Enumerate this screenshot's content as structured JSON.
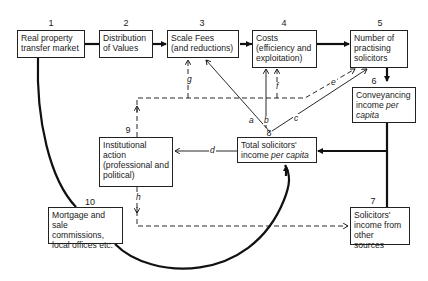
{
  "diagram": {
    "nodes": [
      {
        "id": "1",
        "number": "1",
        "lines": [
          "Real property",
          "transfer market"
        ]
      },
      {
        "id": "2",
        "number": "2",
        "lines": [
          "Distribution",
          "of Values"
        ]
      },
      {
        "id": "3",
        "number": "3",
        "lines": [
          "Scale Fees",
          "(and reductions)"
        ]
      },
      {
        "id": "4",
        "number": "4",
        "lines": [
          "Costs",
          "(efficiency and",
          "exploitation)"
        ]
      },
      {
        "id": "5",
        "number": "5",
        "lines": [
          "Number of",
          "practising",
          "solicitors"
        ]
      },
      {
        "id": "6",
        "number": "6",
        "lines": [
          "Conveyancing",
          "income ",
          "capita"
        ],
        "italic_parts": [
          "per"
        ]
      },
      {
        "id": "7",
        "number": "7",
        "lines": [
          "Solicitors'",
          "income from",
          "other sources"
        ]
      },
      {
        "id": "8",
        "number": "8",
        "lines": [
          "Total solicitors'",
          "income "
        ],
        "italic_parts": [
          "per capita"
        ]
      },
      {
        "id": "9",
        "number": "9",
        "lines": [
          "Institutional",
          "action",
          "(professional and",
          "political)"
        ]
      },
      {
        "id": "10",
        "number": "10",
        "lines": [
          "Mortgage and",
          "sale commissions,",
          "local offices etc."
        ]
      }
    ],
    "box6": {
      "line1": "Conveyancing",
      "line2a": "income ",
      "line2b": "per",
      "line3": "capita"
    },
    "box8": {
      "line1": "Total solicitors'",
      "line2a": "income ",
      "line2b": "per capita"
    },
    "edge_labels": {
      "a": "a",
      "b": "b",
      "c": "c",
      "d": "d",
      "e": "e",
      "f": "f",
      "g": "g",
      "h": "h"
    },
    "edges": [
      {
        "from": "1",
        "to": "2",
        "style": "thick"
      },
      {
        "from": "2",
        "to": "3",
        "style": "thick-arrow"
      },
      {
        "from": "3",
        "to": "4",
        "style": "thick-arrow"
      },
      {
        "from": "4",
        "to": "5",
        "style": "thick-arrow"
      },
      {
        "from": "5",
        "to": "6",
        "style": "thick-arrow"
      },
      {
        "from": "6",
        "to": "8",
        "style": "thick-arrow"
      },
      {
        "from": "7",
        "to": "8",
        "style": "thick"
      },
      {
        "from": "1",
        "to": "8",
        "via": "10",
        "style": "thick-curve-arrow"
      },
      {
        "from": "8",
        "to": "3",
        "label": "a",
        "style": "thin-arrow"
      },
      {
        "from": "8",
        "to": "4",
        "label": "b",
        "style": "thin-arrow"
      },
      {
        "from": "8",
        "to": "5",
        "label": "c",
        "style": "thin-arrow"
      },
      {
        "from": "8",
        "to": "9",
        "label": "d",
        "style": "thin-arrow"
      },
      {
        "from": "9",
        "to": "5",
        "label": "e",
        "style": "dashed-arrow"
      },
      {
        "from": "9",
        "to": "4",
        "label": "f",
        "style": "dashed-arrow"
      },
      {
        "from": "9",
        "to": "3",
        "label": "g",
        "style": "dashed-arrow"
      },
      {
        "from": "9",
        "to": "7",
        "label": "h",
        "style": "dashed-arrow"
      }
    ]
  }
}
